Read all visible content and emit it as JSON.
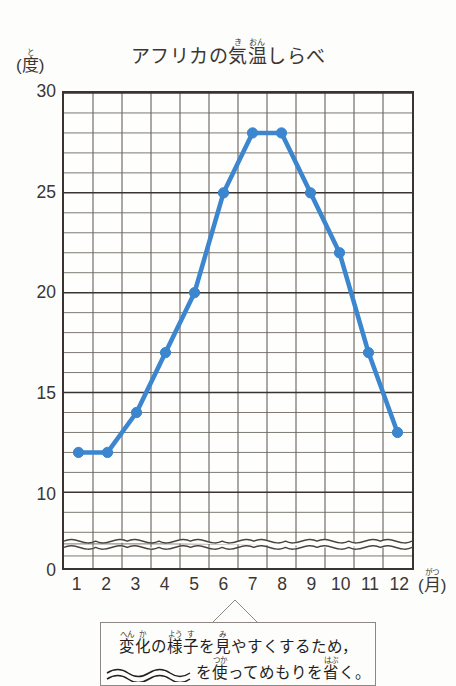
{
  "chart": {
    "title_text": "アフリカの気温しらべ",
    "title_parts": [
      {
        "text": "アフリカの",
        "ruby": ""
      },
      {
        "text": "気",
        "ruby": "き"
      },
      {
        "text": "温",
        "ruby": "おん"
      },
      {
        "text": "しらべ",
        "ruby": ""
      }
    ],
    "y_unit_base": "(度)",
    "y_unit_kanji": "度",
    "y_unit_ruby": "と",
    "y_unit_open": "(",
    "y_unit_close": ")",
    "x_unit_open": "(",
    "x_unit_kanji": "月",
    "x_unit_ruby": "がつ",
    "x_unit_close": ")"
  },
  "chart_data": {
    "type": "line",
    "xlabel": "(月)",
    "ylabel": "(度)",
    "categories": [
      "1",
      "2",
      "3",
      "4",
      "5",
      "6",
      "7",
      "8",
      "9",
      "10",
      "11",
      "12"
    ],
    "values": [
      12,
      12,
      14,
      17,
      20,
      25,
      28,
      28,
      25,
      22,
      17,
      13
    ],
    "series": [
      {
        "name": "気温",
        "values": [
          12,
          12,
          14,
          17,
          20,
          25,
          28,
          28,
          25,
          22,
          17,
          13
        ],
        "color": "#3b86cf"
      }
    ],
    "y_tick_labels": [
      "0",
      "10",
      "15",
      "20",
      "25",
      "30"
    ],
    "y_tick_values": [
      0,
      10,
      15,
      20,
      25,
      30
    ],
    "ylim": [
      0,
      30
    ],
    "y_major_step": 5,
    "y_minor_step": 1,
    "axis_break": true,
    "axis_break_range": [
      1,
      8
    ],
    "grid": true,
    "legend": "none",
    "line_color": "#3b86cf",
    "grid_color": "#6e6862",
    "axis_color": "#3a3431"
  },
  "callout": {
    "line1_parts": [
      {
        "text": "変",
        "ruby": "へん"
      },
      {
        "text": "化",
        "ruby": "か"
      },
      {
        "text": "の",
        "ruby": ""
      },
      {
        "text": "様",
        "ruby": "よう"
      },
      {
        "text": "子",
        "ruby": "す"
      },
      {
        "text": "を",
        "ruby": ""
      },
      {
        "text": "見",
        "ruby": "み"
      },
      {
        "text": "やすくするため，",
        "ruby": ""
      }
    ],
    "line1_text": "変化の様子を見やすくするため，",
    "line2_parts": [
      {
        "text": "を",
        "ruby": ""
      },
      {
        "text": "使",
        "ruby": "つか"
      },
      {
        "text": "ってめもりを",
        "ruby": ""
      },
      {
        "text": "省",
        "ruby": "はぶ"
      },
      {
        "text": "く。",
        "ruby": ""
      }
    ],
    "line2_text": "〰〰 を使ってめもりを省く。",
    "wave_symbol": "wave-break-symbol"
  }
}
